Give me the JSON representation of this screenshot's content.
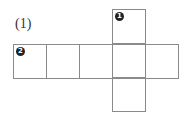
{
  "figure": {
    "label": "(1)",
    "faces": [
      {
        "id": "top",
        "marker": "1"
      },
      {
        "id": "row-1",
        "marker": "2"
      },
      {
        "id": "row-2",
        "marker": ""
      },
      {
        "id": "row-3",
        "marker": ""
      },
      {
        "id": "row-4",
        "marker": ""
      },
      {
        "id": "row-5",
        "marker": ""
      },
      {
        "id": "bottom",
        "marker": ""
      }
    ]
  }
}
